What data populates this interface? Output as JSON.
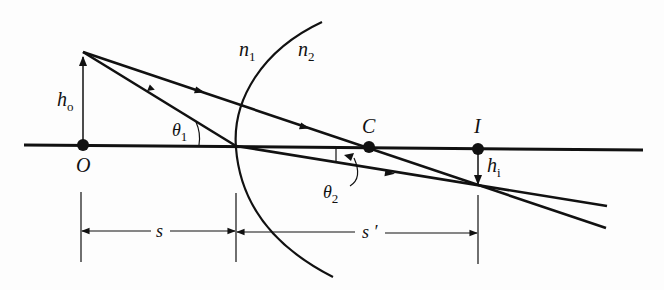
{
  "diagram": {
    "type": "ray-optics",
    "labels": {
      "object_point": "O",
      "object_height": "h",
      "object_height_sub": "o",
      "center_of_curvature": "C",
      "image_point": "I",
      "image_height": "h",
      "image_height_sub": "i",
      "index_left": "n",
      "index_left_sub": "1",
      "index_right": "n",
      "index_right_sub": "2",
      "angle_incident": "θ",
      "angle_incident_sub": "1",
      "angle_refracted": "θ",
      "angle_refracted_sub": "2",
      "object_distance": "s",
      "image_distance": "s ′"
    },
    "elements": [
      {
        "id": "optical-axis",
        "kind": "line"
      },
      {
        "id": "refracting-surface",
        "kind": "arc",
        "convex_toward": "object"
      },
      {
        "id": "object-arrow",
        "kind": "arrow",
        "direction": "up"
      },
      {
        "id": "image-arrow",
        "kind": "arrow",
        "direction": "down"
      },
      {
        "id": "ray-through-vertex",
        "kind": "ray"
      },
      {
        "id": "ray-through-center",
        "kind": "ray"
      },
      {
        "id": "dimension-s",
        "kind": "dimension"
      },
      {
        "id": "dimension-s-prime",
        "kind": "dimension"
      }
    ],
    "colors": {
      "ink": "#111111",
      "background": "#fdfdfd"
    }
  }
}
